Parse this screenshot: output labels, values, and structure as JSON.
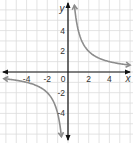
{
  "chart_data": {
    "type": "line",
    "title": "",
    "function": "y = 4/x",
    "xlabel": "x",
    "ylabel": "y",
    "xlim": [
      -6.5,
      6.2
    ],
    "ylim": [
      -6.7,
      6.8
    ],
    "x_ticks": [
      -4,
      -2,
      0,
      2,
      4
    ],
    "y_ticks": [
      4,
      2,
      -2,
      -4
    ],
    "x_tick_labels": [
      "-4",
      "-2",
      "0",
      "2",
      "4"
    ],
    "y_tick_labels": [
      "4",
      "2",
      "-2",
      "-4"
    ],
    "grid": true,
    "series": [
      {
        "name": "branch-q1",
        "x": [
          0.6,
          0.8,
          1,
          1.5,
          2,
          3,
          4,
          5,
          5.8
        ],
        "y": [
          6.67,
          5,
          4,
          2.67,
          2,
          1.33,
          1,
          0.8,
          0.69
        ]
      },
      {
        "name": "branch-q3",
        "x": [
          -6.2,
          -5,
          -4,
          -3,
          -2,
          -1.5,
          -1,
          -0.8,
          -0.65
        ],
        "y": [
          -0.65,
          -0.8,
          -1,
          -1.33,
          -2,
          -2.67,
          -4,
          -5,
          -6.15
        ]
      }
    ],
    "colors": {
      "curve": "#8c8c8c",
      "axis": "#111111",
      "grid": "#dcdcdc"
    }
  }
}
